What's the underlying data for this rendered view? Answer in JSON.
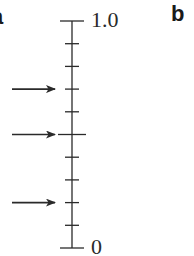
{
  "panels": {
    "left_label": "a",
    "right_label": "b"
  },
  "scale": {
    "top_label": "1.0",
    "bottom_label": "0",
    "min": 0,
    "max": 1.0,
    "tick_step": 0.1,
    "tick_values": [
      0,
      0.1,
      0.2,
      0.3,
      0.4,
      0.5,
      0.6,
      0.7,
      0.8,
      0.9,
      1.0
    ],
    "long_tick_values": [
      0,
      0.5,
      1.0
    ],
    "arrows_at": [
      0.7,
      0.5,
      0.2
    ],
    "arrow_direction": "right",
    "line_color": "#2a2a2a"
  }
}
